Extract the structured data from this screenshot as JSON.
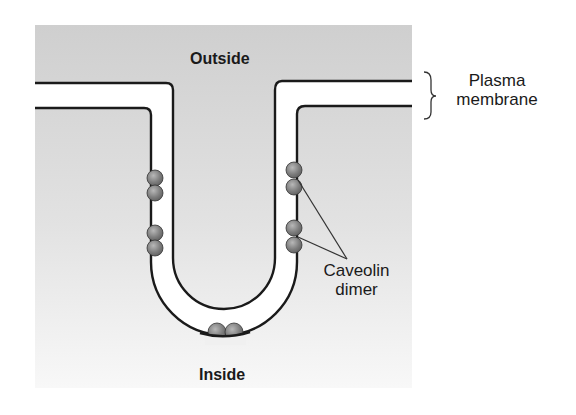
{
  "figure": {
    "type": "biology-diagram",
    "colors": {
      "background": "#ffffff",
      "panel_top": "#cfcfcf",
      "panel_bottom": "#f7f7f7",
      "membrane_fill": "#ffffff",
      "membrane_stroke": "#1a1a1a",
      "dimer_fill": "#7a7a7a",
      "dimer_highlight": "#b5b5b5"
    }
  },
  "labels": {
    "outside": "Outside",
    "inside": "Inside",
    "plasma_membrane_line1": "Plasma",
    "plasma_membrane_line2": "membrane",
    "caveolin_line1": "Caveolin",
    "caveolin_line2": "dimer"
  },
  "elements": {
    "membrane": {
      "name": "plasma-membrane",
      "shape": "U-shaped invagination (caveola)"
    },
    "dimers": [
      {
        "id": "left-upper",
        "side": "left"
      },
      {
        "id": "left-lower",
        "side": "left"
      },
      {
        "id": "right-upper",
        "side": "right",
        "labeled": true
      },
      {
        "id": "right-lower",
        "side": "right",
        "labeled": true
      },
      {
        "id": "bottom",
        "side": "bottom"
      }
    ]
  }
}
